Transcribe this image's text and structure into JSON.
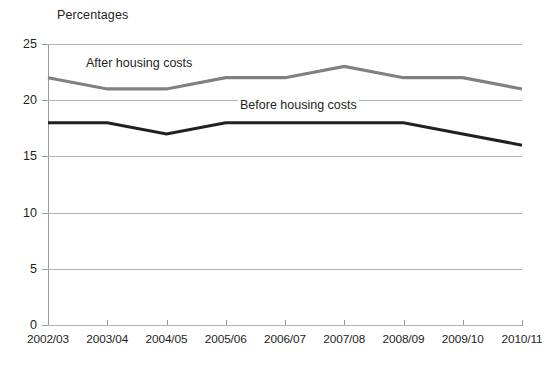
{
  "chart_data": {
    "type": "line",
    "title": "Percentages",
    "xlabel": "",
    "ylabel": "",
    "ylim": [
      0,
      25
    ],
    "ytick_step": 5,
    "yticks": [
      "0",
      "5",
      "10",
      "15",
      "20",
      "25"
    ],
    "grid": true,
    "legend_position": "inline-annotations",
    "categories": [
      "2002/03",
      "2003/04",
      "2004/05",
      "2005/06",
      "2006/07",
      "2007/08",
      "2008/09",
      "2009/10",
      "2010/11"
    ],
    "series": [
      {
        "name": "After housing costs",
        "color": "#808080",
        "values": [
          22,
          21,
          21,
          22,
          22,
          23,
          22,
          22,
          21
        ]
      },
      {
        "name": "Before housing costs",
        "color": "#231f20",
        "values": [
          18,
          18,
          17,
          18,
          18,
          18,
          18,
          17,
          16
        ]
      }
    ]
  },
  "annotations": {
    "after_label": "After housing costs",
    "before_label": "Before housing costs"
  },
  "colors": {
    "after_line": "#808080",
    "before_line": "#231f20",
    "gridline": "#b3b3b3",
    "axis": "#9a9a9a",
    "text": "#231f20",
    "background": "#ffffff"
  }
}
